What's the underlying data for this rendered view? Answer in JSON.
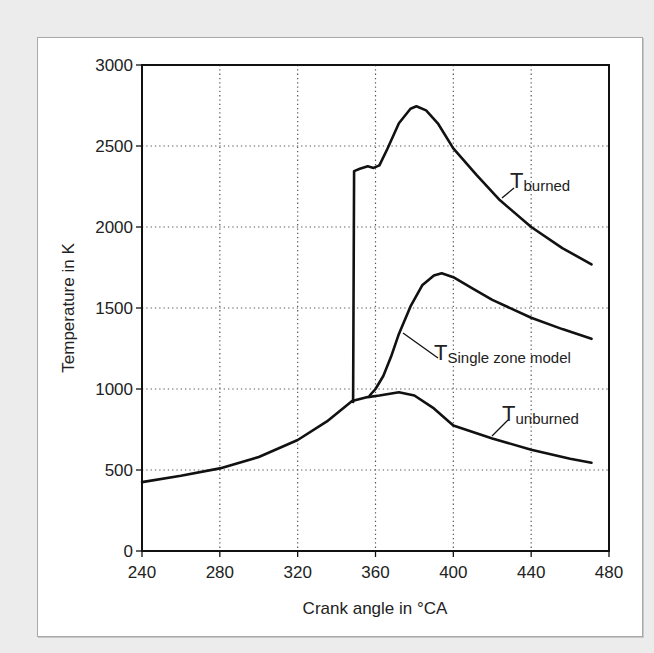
{
  "chart_data": {
    "type": "line",
    "title": "",
    "xlabel": "Crank angle in °CA",
    "ylabel": "Temperature in K",
    "xlim": [
      240,
      480
    ],
    "ylim": [
      0,
      3000
    ],
    "xticks": [
      240,
      280,
      320,
      360,
      400,
      440,
      480
    ],
    "yticks": [
      0,
      500,
      1000,
      1500,
      2000,
      2500,
      3000
    ],
    "grid": true,
    "legend": "inline labels",
    "series": [
      {
        "name": "T_unburned",
        "label_main": "T",
        "label_sub": "unburned",
        "x": [
          240,
          260,
          280,
          300,
          320,
          335,
          348,
          356,
          362,
          372,
          380,
          390,
          400,
          420,
          440,
          460,
          471
        ],
        "y": [
          425,
          465,
          510,
          580,
          685,
          800,
          925,
          950,
          960,
          980,
          960,
          880,
          775,
          695,
          625,
          570,
          545
        ]
      },
      {
        "name": "T_burned",
        "label_main": "T",
        "label_sub": "burned",
        "x": [
          348.5,
          349,
          352,
          356,
          359,
          362,
          366,
          372,
          378,
          381,
          386,
          392,
          400,
          412,
          424,
          440,
          456,
          471
        ],
        "y": [
          920,
          2345,
          2360,
          2375,
          2365,
          2380,
          2480,
          2640,
          2730,
          2745,
          2720,
          2640,
          2485,
          2320,
          2165,
          2000,
          1870,
          1770
        ]
      },
      {
        "name": "T_Single zone model",
        "label_main": "T",
        "label_sub": "Single zone model",
        "x": [
          357,
          360,
          364,
          368,
          372,
          378,
          384,
          390,
          394,
          400,
          410,
          420,
          440,
          456,
          471
        ],
        "y": [
          960,
          1000,
          1080,
          1200,
          1340,
          1510,
          1640,
          1700,
          1715,
          1690,
          1620,
          1550,
          1440,
          1370,
          1310
        ]
      }
    ]
  },
  "labels": {
    "xlabel": "Crank angle in °CA",
    "ylabel": "Temperature in K",
    "burned_main": "T",
    "burned_sub": "burned",
    "single_main": "T",
    "single_sub": "Single zone model",
    "unburned_main": "T",
    "unburned_sub": "unburned"
  }
}
